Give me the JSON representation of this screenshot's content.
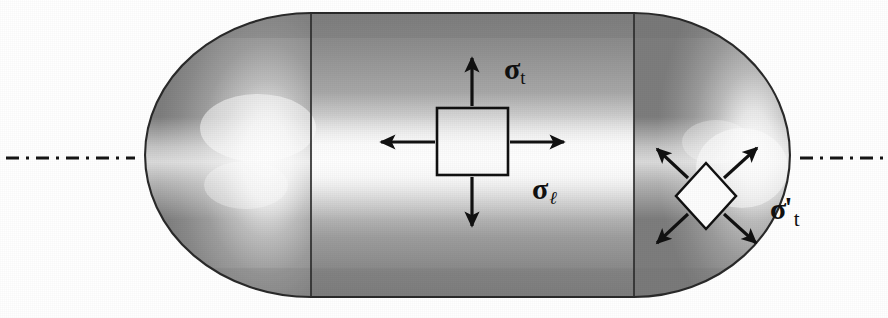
{
  "figure": {
    "background_color": "#ffffff",
    "shell_stroke": "#1a1a1a",
    "label_color": "#111111"
  },
  "labels": {
    "hoop_stress": {
      "id": "sigma-t",
      "sigma": "σ",
      "subscript": "t",
      "full": "σt",
      "meaning": "tangential (hoop) stress in cylinder"
    },
    "longitudinal_stress": {
      "id": "sigma-l",
      "sigma": "σ",
      "subscript": "ℓ",
      "full": "σℓ",
      "meaning": "longitudinal stress in cylinder"
    },
    "head_stress": {
      "id": "sigma-t-prime",
      "sigma": "σ",
      "prime": "'",
      "subscript": "t",
      "full": "σ't",
      "meaning": "tangential stress in hemispherical head"
    }
  },
  "elements": {
    "vessel": {
      "name": "pressure-vessel-shell",
      "shape": "cylinder-with-hemispherical-ends",
      "left_edge_x": 145,
      "right_edge_x": 790,
      "top_edge_y": 13,
      "bottom_edge_y": 297
    },
    "weld_lines": {
      "name": "weld-seam-lines",
      "count": 2,
      "x_positions": [
        311,
        634
      ]
    },
    "centerline": {
      "name": "axis-centerline",
      "style": "dash-dot",
      "y": 158,
      "left_segment": [
        6,
        135
      ],
      "right_segment": [
        800,
        884
      ]
    },
    "cylinder_stress_element": {
      "name": "cylinder-stress-element",
      "shape": "square",
      "x": 437,
      "y": 108,
      "width": 71,
      "height": 67,
      "arrows": [
        "up",
        "down",
        "left",
        "right"
      ]
    },
    "head_stress_element": {
      "name": "head-stress-element",
      "shape": "diamond",
      "center_x": 706,
      "center_y": 196,
      "half_width": 30,
      "half_height": 33,
      "arrows": [
        "up-left",
        "up-right",
        "down-left",
        "down-right"
      ]
    }
  },
  "colors": {
    "shell_dark": "#7a7a7a",
    "shell_mid": "#9c9c9c",
    "shell_highlight": "#fbfbfb",
    "shell_edge": "#2a2a2a",
    "ink": "#111111"
  }
}
